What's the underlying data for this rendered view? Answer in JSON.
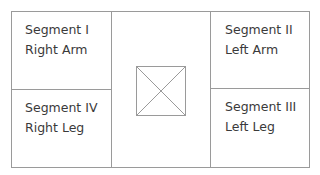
{
  "diagram": {
    "segments": [
      {
        "id": "I",
        "title": "Segment I",
        "part": "Right Arm",
        "position": "top-left"
      },
      {
        "id": "II",
        "title": "Segment II",
        "part": "Left Arm",
        "position": "top-right"
      },
      {
        "id": "III",
        "title": "Segment III",
        "part": "Left Leg",
        "position": "bottom-right"
      },
      {
        "id": "IV",
        "title": "Segment IV",
        "part": "Right Leg",
        "position": "bottom-left"
      }
    ],
    "center": {
      "icon": "crossed-box-icon"
    },
    "colors": {
      "line": "#9a9a9a",
      "text": "#3a3a3a",
      "background": "#ffffff"
    }
  }
}
